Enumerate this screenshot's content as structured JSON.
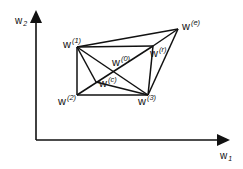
{
  "diagram": {
    "axes": {
      "x_label": "w",
      "x_sub": "1",
      "y_label": "w",
      "y_sub": "2"
    },
    "points": [
      {
        "id": "w1",
        "label": "w",
        "sup": "(1)",
        "x": 77,
        "y": 47
      },
      {
        "id": "w2",
        "label": "w",
        "sup": "(2)",
        "x": 77,
        "y": 95
      },
      {
        "id": "w3",
        "label": "w",
        "sup": "(3)",
        "x": 148,
        "y": 95
      },
      {
        "id": "we",
        "label": "w",
        "sup": "(e)",
        "x": 178,
        "y": 29
      },
      {
        "id": "wr",
        "label": "w",
        "sup": "(r)",
        "x": 153,
        "y": 46
      },
      {
        "id": "w0",
        "label": "w",
        "sup": "(0)",
        "x": 113,
        "y": 71
      },
      {
        "id": "wc",
        "label": "w",
        "sup": "(c)",
        "x": 96,
        "y": 82
      }
    ],
    "edges": [
      [
        "w1",
        "wr"
      ],
      [
        "wr",
        "w3"
      ],
      [
        "w3",
        "w2"
      ],
      [
        "w2",
        "w1"
      ],
      [
        "w1",
        "we"
      ],
      [
        "we",
        "w3"
      ],
      [
        "we",
        "wr"
      ],
      [
        "w1",
        "w3"
      ],
      [
        "w2",
        "wr"
      ],
      [
        "w1",
        "wc"
      ],
      [
        "wc",
        "w3"
      ]
    ],
    "colors": {
      "line": "#111111",
      "background": "#ffffff"
    }
  }
}
